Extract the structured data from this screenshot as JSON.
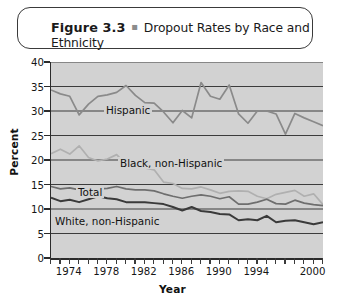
{
  "figure": {
    "label": "Figure 3.3",
    "bullet": "▪",
    "caption": "Dropout Rates by Race and Ethnicity"
  },
  "axes": {
    "ylabel": "Percent",
    "xlabel": "Year",
    "yticks": [
      "0",
      "5",
      "10",
      "15",
      "20",
      "25",
      "30",
      "35",
      "40"
    ],
    "xticklabels": [
      "1974",
      "1978",
      "1982",
      "1986",
      "1990",
      "1994",
      "2000"
    ]
  },
  "series_labels": {
    "hispanic": "Hispanic",
    "black": "Black, non-Hispanic",
    "total": "Total",
    "white": "White, non-Hispanic"
  },
  "colors": {
    "plot_background": "#d2d2d2",
    "axis": "#2b2b2b",
    "gridline": "#3c3c3c",
    "hispanic": "#8a8a8a",
    "black": "#b0b0b0",
    "total": "#6e6e6e",
    "white": "#3a3a3a",
    "title_border": "#3a3a3a",
    "text": "#161616"
  },
  "chart_data": {
    "type": "line",
    "title": "Dropout Rates by Race and Ethnicity",
    "xlabel": "Year",
    "ylabel": "Percent",
    "xlim": [
      1972,
      2001
    ],
    "ylim": [
      0,
      40
    ],
    "grid": true,
    "gridlines_y": [
      5,
      10,
      15,
      20,
      25,
      30,
      35,
      40
    ],
    "legend": "inline-labels",
    "x": [
      1972,
      1973,
      1974,
      1975,
      1976,
      1977,
      1978,
      1979,
      1980,
      1981,
      1982,
      1983,
      1984,
      1985,
      1986,
      1987,
      1988,
      1989,
      1990,
      1991,
      1992,
      1993,
      1994,
      1995,
      1996,
      1997,
      1998,
      1999,
      2000,
      2001
    ],
    "series": [
      {
        "name": "Hispanic",
        "values": [
          34.3,
          33.5,
          33.0,
          29.2,
          31.4,
          33.0,
          33.3,
          33.8,
          35.2,
          33.2,
          31.7,
          31.6,
          29.8,
          27.6,
          30.1,
          28.6,
          35.8,
          33.0,
          32.4,
          35.3,
          29.4,
          27.5,
          30.0,
          30.0,
          29.4,
          25.3,
          29.5,
          28.6,
          27.8,
          27.0
        ]
      },
      {
        "name": "Black, non-Hispanic",
        "values": [
          21.3,
          22.2,
          21.2,
          22.9,
          20.5,
          19.8,
          20.2,
          21.1,
          19.1,
          18.4,
          18.4,
          18.0,
          15.5,
          15.2,
          14.2,
          14.1,
          14.5,
          13.9,
          13.2,
          13.6,
          13.7,
          13.6,
          12.6,
          12.1,
          13.0,
          13.4,
          13.8,
          12.6,
          13.1,
          10.9
        ]
      },
      {
        "name": "Total",
        "values": [
          14.6,
          14.1,
          14.3,
          13.9,
          14.1,
          14.1,
          14.2,
          14.6,
          14.1,
          13.9,
          13.9,
          13.7,
          13.1,
          12.6,
          12.2,
          12.6,
          12.9,
          12.6,
          12.1,
          12.5,
          11.0,
          11.0,
          11.4,
          12.0,
          11.1,
          11.0,
          11.8,
          11.2,
          10.9,
          10.7
        ]
      },
      {
        "name": "White, non-Hispanic",
        "values": [
          12.3,
          11.6,
          11.9,
          11.4,
          12.0,
          12.6,
          12.2,
          12.0,
          11.4,
          11.4,
          11.4,
          11.2,
          11.0,
          10.4,
          9.7,
          10.4,
          9.6,
          9.4,
          9.0,
          8.9,
          7.7,
          7.9,
          7.7,
          8.6,
          7.3,
          7.6,
          7.7,
          7.3,
          6.9,
          7.3
        ]
      }
    ]
  }
}
